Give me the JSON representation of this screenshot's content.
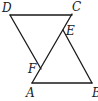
{
  "diagram": {
    "type": "geometry",
    "points": {
      "D": {
        "label": "D",
        "x": 10,
        "y": 15
      },
      "C": {
        "label": "C",
        "x": 72,
        "y": 14
      },
      "E": {
        "label": "E",
        "x": 63,
        "y": 30
      },
      "F": {
        "label": "F",
        "x": 41,
        "y": 68
      },
      "A": {
        "label": "A",
        "x": 32,
        "y": 83
      },
      "B": {
        "label": "B",
        "x": 92,
        "y": 83
      }
    },
    "segments": [
      [
        "D",
        "C"
      ],
      [
        "D",
        "F"
      ],
      [
        "A",
        "C"
      ],
      [
        "E",
        "B"
      ],
      [
        "A",
        "B"
      ]
    ],
    "labels": {
      "D": "D",
      "C": "C",
      "E": "E",
      "F": "F",
      "A": "A",
      "B": "B"
    },
    "line_color": "#1a1a1a",
    "background": "#ffffff"
  }
}
